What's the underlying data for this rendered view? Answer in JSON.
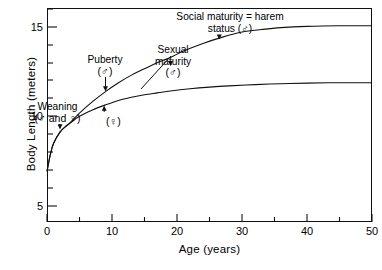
{
  "chart_data": {
    "type": "line",
    "title": "",
    "xlabel": "Age  (years)",
    "ylabel": "Body  Length  (meters)",
    "xlim": [
      0,
      50
    ],
    "ylim": [
      0,
      16.9
    ],
    "xticks_major": [
      0,
      10,
      20,
      30,
      40,
      50
    ],
    "xticks_minor": [
      5,
      15,
      25,
      35,
      45
    ],
    "yticks_major": [
      5,
      10,
      15
    ],
    "yticks_minor": [
      6,
      7,
      8,
      9,
      11,
      12,
      13,
      14,
      16
    ],
    "grid": false,
    "legend": "none",
    "series": [
      {
        "name": "male",
        "symbol": "male-symbol",
        "x": [
          0,
          0.5,
          1,
          2,
          3,
          3.5,
          5,
          7,
          9,
          11,
          13,
          15,
          17,
          19,
          21,
          24,
          27,
          30,
          33,
          36,
          40,
          45,
          50
        ],
        "y": [
          4.0,
          5.3,
          6.2,
          7.1,
          7.6,
          7.8,
          8.6,
          9.5,
          10.3,
          11.0,
          11.6,
          12.1,
          12.6,
          13.0,
          13.5,
          14.1,
          14.6,
          15.0,
          15.2,
          15.35,
          15.45,
          15.5,
          15.5
        ]
      },
      {
        "name": "female",
        "symbol": "female-symbol",
        "x": [
          0,
          0.5,
          1,
          2,
          3,
          3.5,
          5,
          7,
          9,
          11,
          13,
          15,
          17,
          19,
          22,
          25,
          28,
          32,
          36,
          40,
          45,
          50
        ],
        "y": [
          4.0,
          5.3,
          6.2,
          7.1,
          7.6,
          7.8,
          8.35,
          8.85,
          9.25,
          9.6,
          9.85,
          10.05,
          10.2,
          10.35,
          10.52,
          10.65,
          10.75,
          10.85,
          10.92,
          10.97,
          11.0,
          11.0
        ]
      }
    ],
    "annotations": [
      {
        "name": "weaning",
        "text_line1": "Weaning",
        "text_line2": "(♂ and ♀)",
        "arrow_to_x": 2.0,
        "arrow_to_y": 7.4
      },
      {
        "name": "puberty",
        "text_line1": "Puberty",
        "text_line2": "(♂)",
        "arrow_to_x": 9.0,
        "arrow_to_y": 10.4
      },
      {
        "name": "puberty-female",
        "text_line1": "(♀)",
        "arrow_to_x": 8.8,
        "arrow_to_y": 9.1
      },
      {
        "name": "sexual-maturity",
        "text_line1": "Sexual",
        "text_line2": "maturity",
        "text_line3": "(♂)",
        "arrow_to_x": 19.0,
        "arrow_to_y": 12.4
      },
      {
        "name": "social-maturity",
        "text_line1": "Social maturity = harem",
        "text_line2": "status (♂)",
        "arrow_to_x": 26.5,
        "arrow_to_y": 14.5
      }
    ]
  },
  "axis": {
    "y_title": "Body  Length  (meters)",
    "x_title": "Age  (years)",
    "y_tick_labels": [
      "15",
      "10",
      "5"
    ],
    "x_tick_labels": [
      "0",
      "10",
      "20",
      "30",
      "40",
      "50"
    ]
  },
  "annotations_text": {
    "weaning_l1": "Weaning",
    "weaning_l2": "(♂ and ♀)",
    "puberty_l1": "Puberty",
    "puberty_l2": "(♂)",
    "puberty_female": "(♀)",
    "sexual_l1": "Sexual",
    "sexual_l2": "maturity",
    "sexual_l3": "(♂)",
    "social_l1": "Social maturity = harem",
    "social_l2": "status (♂)"
  }
}
